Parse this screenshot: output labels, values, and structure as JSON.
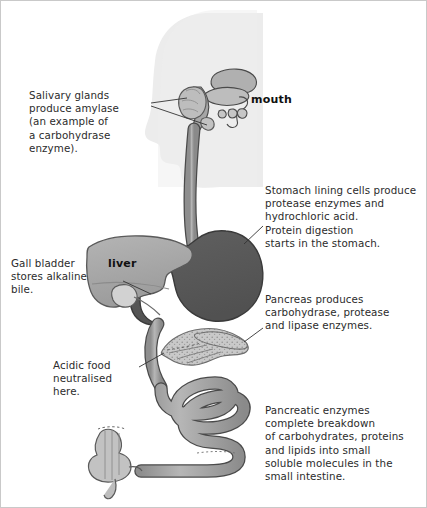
{
  "diagram": {
    "background_color": "#ffffff",
    "border_color": "#c9c9c9",
    "palette": {
      "head_silhouette": "#ececec",
      "stomach": "#5a5a5a",
      "liver": "#a8a8a8",
      "tube": "#9b9b9b",
      "pancreas": "#c4c4c4",
      "outline": "#4a4a4a",
      "leader_line": "#3c3c3c",
      "text": "#2b2b2b"
    }
  },
  "organ_labels": {
    "mouth": "mouth",
    "liver": "liver"
  },
  "annotations": {
    "salivary": "Salivary glands\nproduce amylase\n(an example of\na carbohydrase\nenzyme).",
    "stomach": "Stomach lining cells produce\nprotease enzymes and\nhydrochloric acid.\nProtein digestion\nstarts in the stomach.",
    "gall_bladder": "Gall bladder\nstores alkaline\nbile.",
    "pancreas": "Pancreas produces\ncarbohydrase, protease\nand lipase enzymes.",
    "acidic_food": "Acidic food\nneutralised\nhere.",
    "pancreatic_enzymes": "Pancreatic enzymes\ncomplete breakdown\nof carbohydrates, proteins\nand lipids into small\nsoluble molecules in the\nsmall intestine."
  }
}
